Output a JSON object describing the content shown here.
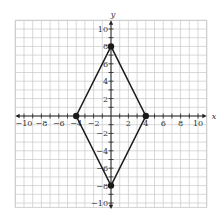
{
  "chart_data": {
    "type": "scatter",
    "title": "",
    "xlabel": "x",
    "ylabel": "y",
    "xlim": [
      -11,
      11
    ],
    "ylim": [
      -11,
      11
    ],
    "grid": true,
    "x_ticks": [
      -10,
      -8,
      -6,
      -4,
      -2,
      2,
      4,
      6,
      8,
      10
    ],
    "y_ticks": [
      -10,
      -8,
      -6,
      -4,
      -2,
      2,
      4,
      6,
      8,
      10
    ],
    "x_tick_labels": [
      "−10",
      "−8",
      "−6",
      "−4",
      "−2",
      "2",
      "4",
      "6",
      "8",
      "10"
    ],
    "y_tick_labels": [
      "−10",
      "−8",
      "−6",
      "−4",
      "−2",
      "2",
      "4",
      "6",
      "8",
      "10"
    ],
    "shape": "rhombus",
    "vertices": [
      {
        "x": 0,
        "y": 8
      },
      {
        "x": 4,
        "y": 0
      },
      {
        "x": 0,
        "y": -8
      },
      {
        "x": -4,
        "y": 0
      }
    ],
    "colors": {
      "grid": "#c8c8c8",
      "axis": "#222222",
      "shape": "#1a1a1a"
    }
  }
}
